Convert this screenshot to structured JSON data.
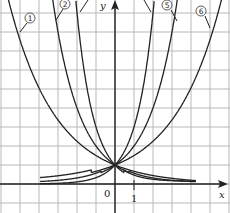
{
  "chart_data": {
    "type": "line",
    "title": "",
    "xlabel": "x",
    "ylabel": "y",
    "origin_label": "0",
    "x_tick_label": "1",
    "xlim": [
      -6,
      6
    ],
    "ylim": [
      -1,
      9.7
    ],
    "grid": true,
    "intersection_point": [
      0,
      1
    ],
    "series": [
      {
        "name": "1",
        "label": "①",
        "function": "y=(2/3)^x",
        "base": 0.667
      },
      {
        "name": "2",
        "label": "②",
        "function": "y=(1/2)^x",
        "base": 0.5
      },
      {
        "name": "3",
        "label": "③",
        "function": "y=(1/3)^x",
        "base": 0.333
      },
      {
        "name": "4",
        "label": "④",
        "function": "y=3^x",
        "base": 3
      },
      {
        "name": "5",
        "label": "⑤",
        "function": "y=2^x",
        "base": 2
      },
      {
        "name": "6",
        "label": "⑥",
        "function": "y=(3/2)^x",
        "base": 1.5
      }
    ]
  },
  "labels": {
    "x_axis": "x",
    "y_axis": "y",
    "origin": "0",
    "tick_one": "1",
    "curve1": "1",
    "curve2": "2",
    "curve5": "5",
    "curve6": "6"
  }
}
